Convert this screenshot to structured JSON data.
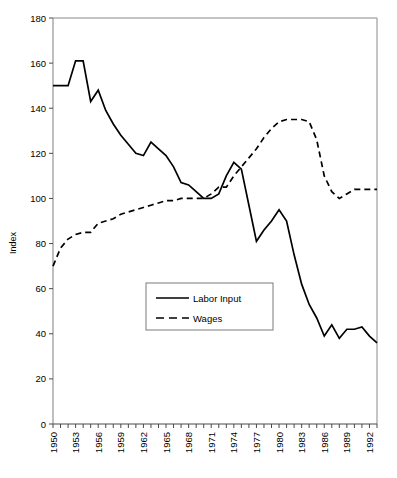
{
  "chart_data": {
    "type": "line",
    "title": "",
    "xlabel": "",
    "ylabel": "Index",
    "ylim": [
      0,
      180
    ],
    "ytick_step": 20,
    "yticks": [
      "0",
      "20",
      "40",
      "60",
      "80",
      "100",
      "120",
      "140",
      "160",
      "180"
    ],
    "xlim": [
      1950,
      1993
    ],
    "xticks_labeled": [
      "1950",
      "1953",
      "1956",
      "1959",
      "1962",
      "1965",
      "1968",
      "1971",
      "1974",
      "1977",
      "1980",
      "1983",
      "1986",
      "1989",
      "1992"
    ],
    "xtick_label_step": 3,
    "xtick_rotation": "vertical",
    "grid": false,
    "legend_position": "center-lower-left",
    "x": [
      1950,
      1951,
      1952,
      1953,
      1954,
      1955,
      1956,
      1957,
      1958,
      1959,
      1960,
      1961,
      1962,
      1963,
      1964,
      1965,
      1966,
      1967,
      1968,
      1969,
      1970,
      1971,
      1972,
      1973,
      1974,
      1975,
      1976,
      1977,
      1978,
      1979,
      1980,
      1981,
      1982,
      1983,
      1984,
      1985,
      1986,
      1987,
      1988,
      1989,
      1990,
      1991,
      1992,
      1993
    ],
    "series": [
      {
        "name": "Labor Input",
        "style": "solid",
        "color": "#000000",
        "values": [
          150,
          150,
          150,
          161,
          161,
          143,
          148,
          139,
          133,
          128,
          124,
          120,
          119,
          125,
          122,
          119,
          114,
          107,
          106,
          103,
          100,
          100,
          102,
          110,
          116,
          113,
          97,
          81,
          86,
          90,
          95,
          90,
          75,
          62,
          53,
          47,
          39,
          44,
          38,
          42,
          42,
          43,
          39,
          36
        ]
      },
      {
        "name": "Wages",
        "style": "dashed",
        "color": "#000000",
        "values": [
          70,
          78,
          82,
          84,
          85,
          85,
          89,
          90,
          91,
          93,
          94,
          95,
          96,
          97,
          98,
          99,
          99,
          100,
          100,
          100,
          100,
          102,
          105,
          105,
          110,
          114,
          118,
          122,
          127,
          131,
          134,
          135,
          135,
          135,
          134,
          126,
          110,
          103,
          100,
          102,
          104,
          104,
          104,
          104
        ]
      }
    ]
  },
  "legend": {
    "items": [
      {
        "label": "Labor Input",
        "style": "solid"
      },
      {
        "label": "Wages",
        "style": "dashed"
      }
    ]
  },
  "axes": {
    "y_title": "Index"
  }
}
